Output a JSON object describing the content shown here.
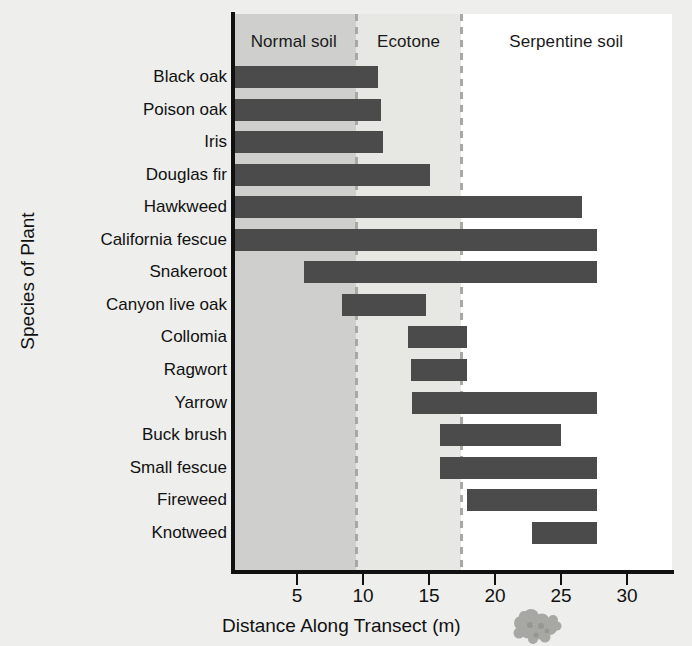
{
  "chart_data": {
    "type": "bar",
    "orientation": "horizontal",
    "title": "",
    "xlabel": "Distance Along Transect (m)",
    "ylabel": "Species of Plant",
    "xlim": [
      0,
      33.4
    ],
    "xticks": [
      5,
      10,
      15,
      20,
      25,
      30
    ],
    "xtick_labels": [
      "5",
      "10",
      "15",
      "20",
      "25",
      "30"
    ],
    "grid": false,
    "legend": "none",
    "bar_color": "#4b4b4b",
    "categories": [
      "Black oak",
      "Poison oak",
      "Iris",
      "Douglas fir",
      "Hawkweed",
      "California fescue",
      "Snakeroot",
      "Canyon live oak",
      "Collomia",
      "Ragwort",
      "Yarrow",
      "Buck brush",
      "Small fescue",
      "Fireweed",
      "Knotweed"
    ],
    "series": [
      {
        "name": "Range along transect (m)",
        "ranges": [
          {
            "species": "Black oak",
            "start": 0.0,
            "end": 11.1
          },
          {
            "species": "Poison oak",
            "start": 0.0,
            "end": 11.4
          },
          {
            "species": "Iris",
            "start": 0.0,
            "end": 11.5
          },
          {
            "species": "Douglas fir",
            "start": 0.0,
            "end": 15.1
          },
          {
            "species": "Hawkweed",
            "start": 0.0,
            "end": 26.6
          },
          {
            "species": "California fescue",
            "start": 0.0,
            "end": 27.7
          },
          {
            "species": "Snakeroot",
            "start": 5.5,
            "end": 27.7
          },
          {
            "species": "Canyon live oak",
            "start": 8.4,
            "end": 14.8
          },
          {
            "species": "Collomia",
            "start": 13.4,
            "end": 17.9
          },
          {
            "species": "Ragwort",
            "start": 13.6,
            "end": 17.9
          },
          {
            "species": "Yarrow",
            "start": 13.7,
            "end": 27.7
          },
          {
            "species": "Buck brush",
            "start": 15.8,
            "end": 25.0
          },
          {
            "species": "Small fescue",
            "start": 15.8,
            "end": 27.7
          },
          {
            "species": "Fireweed",
            "start": 17.9,
            "end": 27.7
          },
          {
            "species": "Knotweed",
            "start": 22.8,
            "end": 27.7
          }
        ]
      }
    ],
    "zones": [
      {
        "label": "Normal soil",
        "start": 0.0,
        "end": 9.5,
        "color": "#cfcfcd"
      },
      {
        "label": "Ecotone",
        "start": 9.5,
        "end": 17.4,
        "color": "#e7e7e4"
      },
      {
        "label": "Serpentine soil",
        "start": 17.4,
        "end": 33.4,
        "color": "#ffffff"
      }
    ],
    "zone_dividers": [
      9.5,
      17.4
    ],
    "annotations": []
  }
}
